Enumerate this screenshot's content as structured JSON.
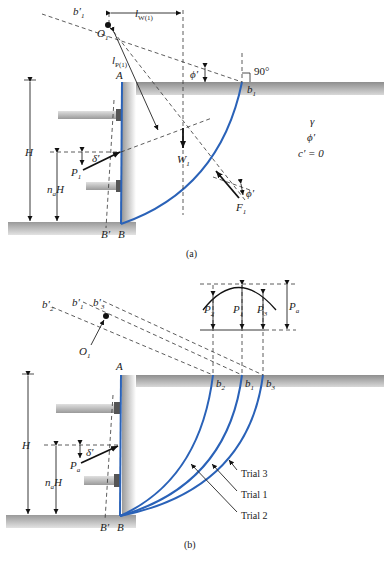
{
  "panel_a": {
    "caption": "(a)",
    "labels": {
      "b1_prime": "b′",
      "b1_prime_sub": "1",
      "O1": "O",
      "O1_sub": "1",
      "l_W1": "l",
      "l_W1_sub": "W(1)",
      "l_P1": "l",
      "l_P1_sub": "P(1)",
      "phi_top": "ϕ′",
      "right_angle": "90°",
      "A": "A",
      "b1": "b",
      "b1_sub": "1",
      "H": "H",
      "delta": "δ′",
      "P1": "P",
      "P1_sub": "1",
      "naH_n": "n",
      "naH_sub": "a",
      "naH_H": "H",
      "W1": "W",
      "W1_sub": "1",
      "gamma": "γ",
      "phi_soil": "ϕ′",
      "c_zero": "c′ = 0",
      "F1": "F",
      "F1_sub": "1",
      "phi_F": "ϕ′",
      "B_prime": "B′",
      "B": "B"
    }
  },
  "panel_b": {
    "caption": "(b)",
    "labels": {
      "b2_prime": "b′",
      "b2_prime_sub": "2",
      "b1_prime": "b′",
      "b1_prime_sub": "1",
      "b3_prime": "b′",
      "b3_prime_sub": "3",
      "O1": "O",
      "O1_sub": "1",
      "P2": "P",
      "P2_sub": "2",
      "P1": "P",
      "P1_sub": "1",
      "P3": "P",
      "P3_sub": "3",
      "Pa": "P",
      "Pa_sub": "a",
      "A": "A",
      "b2": "b",
      "b2_sub": "2",
      "b1": "b",
      "b1_sub": "1",
      "b3": "b",
      "b3_sub": "3",
      "H": "H",
      "delta": "δ′",
      "Pa_force": "P",
      "Pa_force_sub": "a",
      "naH_n": "n",
      "naH_sub": "a",
      "naH_H": "H",
      "trial3": "Trial 3",
      "trial1": "Trial 1",
      "trial2": "Trial 2",
      "B_prime": "B′",
      "B": "B"
    }
  },
  "colors": {
    "failure_surface": "#2a62b8",
    "ground_gray": "#a8a8a8"
  }
}
